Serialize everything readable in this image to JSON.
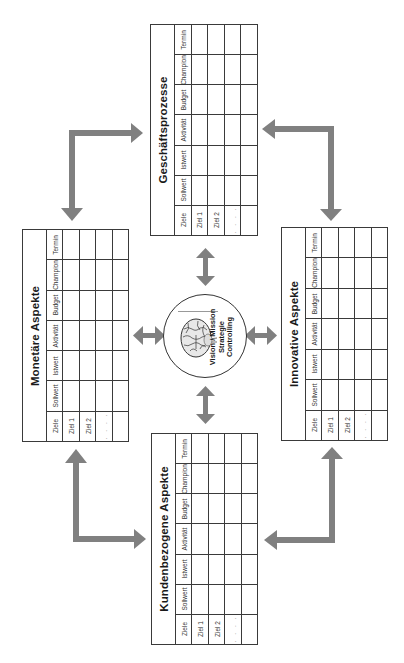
{
  "diagram": {
    "orientation": "rotated-90-ccw",
    "arrow_color": "#808080",
    "line_color": "#3a3a3a"
  },
  "center": {
    "lines": [
      "Vision / Mission",
      "Strategie",
      "Controlling"
    ],
    "icon": "brain-icon"
  },
  "table_columns": [
    "Ziele",
    "Sollwert",
    "Istwert",
    "Aktivität",
    "Budget",
    "Champion",
    "Termin"
  ],
  "row_labels": [
    "Ziel 1",
    "Ziel 2",
    ". . . ."
  ],
  "cards": {
    "top": {
      "title": "Geschäftsprozesse",
      "columns": [
        "Ziele",
        "Sollwert",
        "Istwert",
        "Aktivität",
        "Budget",
        "Champion",
        "Termin"
      ],
      "rows": [
        "Ziel 1",
        "Ziel 2",
        ". . . .",
        ""
      ]
    },
    "left": {
      "title": "Monetäre Aspekte",
      "columns": [
        "Ziele",
        "Sollwert",
        "Istwert",
        "Aktivität",
        "Budget",
        "Champion",
        "Termin"
      ],
      "rows": [
        "Ziel 1",
        "Ziel 2",
        ". . . .",
        ""
      ]
    },
    "right": {
      "title": "Innovative Aspekte",
      "columns": [
        "Ziele",
        "Sollwert",
        "Istwert",
        "Aktivität",
        "Budget",
        "Champion",
        "Termin"
      ],
      "rows": [
        "Ziel 1",
        "Ziel 2",
        ". . . .",
        ""
      ]
    },
    "bottom": {
      "title": "Kundenbezogene Aspekte",
      "columns": [
        "Ziele",
        "Sollwert",
        "Istwert",
        "Aktivität",
        "Budget",
        "Champion",
        "Termin"
      ],
      "rows": [
        "Ziel 1",
        "Ziel 2",
        ". . . .",
        ""
      ]
    }
  }
}
